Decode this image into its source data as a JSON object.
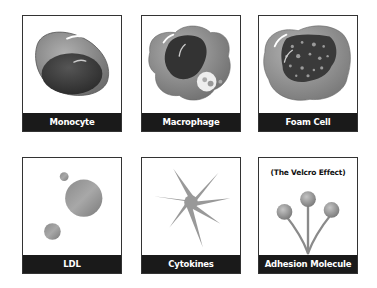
{
  "cards": [
    {
      "label": "Monocyte"
    },
    {
      "label": "Macrophage"
    },
    {
      "label": "Foam Cell"
    },
    {
      "label": "LDL"
    },
    {
      "label": "Cytokines"
    },
    {
      "label": "Adhesion Molecule",
      "caption": "(The Velcro Effect)"
    }
  ],
  "colors": {
    "label_bg": "#1a1a1a",
    "label_text": "#ffffff",
    "cytoplasm": "#8e8e8e",
    "nucleus": "#3c3c3c"
  }
}
